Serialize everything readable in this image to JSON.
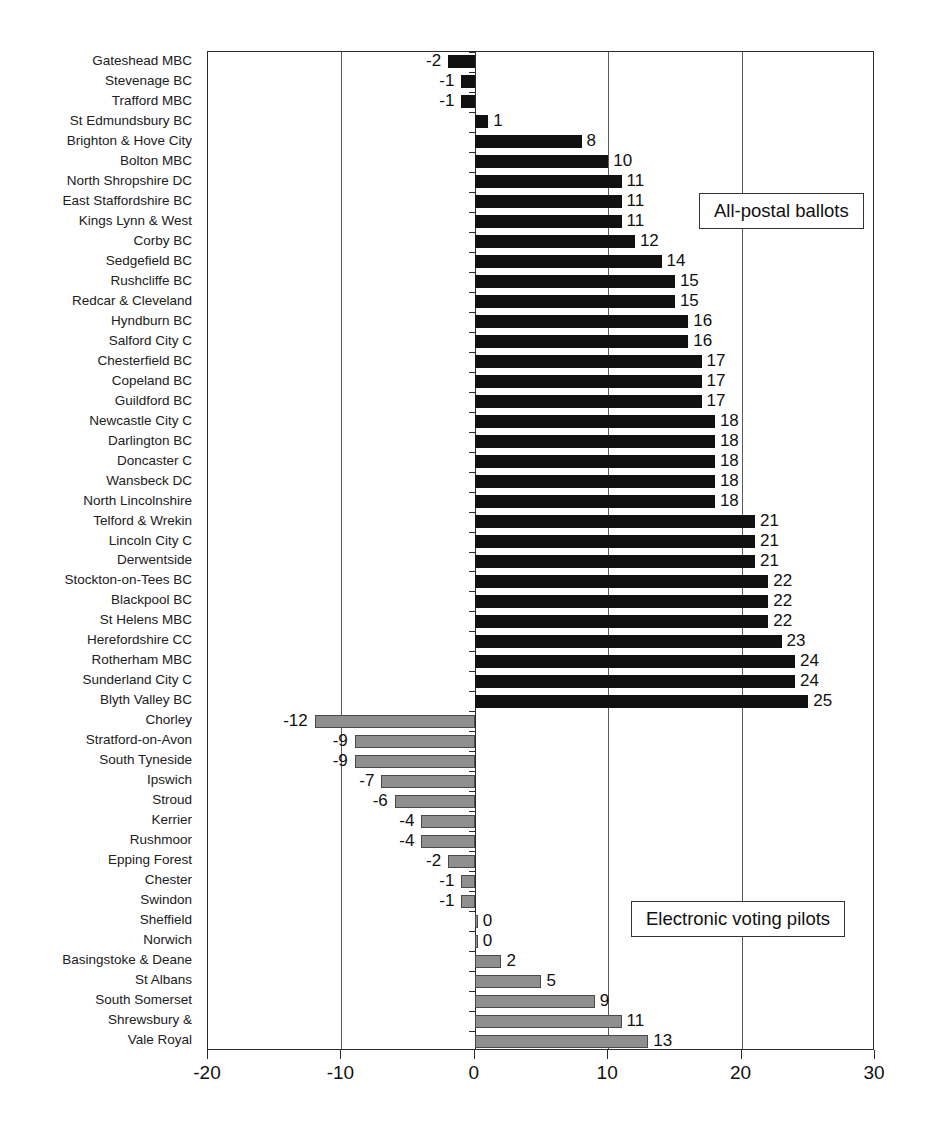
{
  "chart_data": {
    "type": "bar",
    "orientation": "horizontal",
    "title": "",
    "subtitle": "",
    "xlabel": "",
    "ylabel": "",
    "xlim": [
      -20,
      30
    ],
    "xticks": [
      -20,
      -10,
      0,
      10,
      20,
      30
    ],
    "xtick_labels": [
      "-20",
      "-10",
      "0",
      "10",
      "20",
      "30"
    ],
    "grid": true,
    "grid_axis": "x",
    "legend_position": "inside-right",
    "series": [
      {
        "name": "All-postal ballots",
        "color": "#111111",
        "categories": [
          "Gateshead MBC",
          "Stevenage BC",
          "Trafford MBC",
          "St Edmundsbury BC",
          "Brighton & Hove City",
          "Bolton MBC",
          "North Shropshire DC",
          "East Staffordshire BC",
          "Kings Lynn & West",
          "Corby BC",
          "Sedgefield BC",
          "Rushcliffe BC",
          "Redcar & Cleveland",
          "Hyndburn BC",
          "Salford City C",
          "Chesterfield BC",
          "Copeland BC",
          "Guildford BC",
          "Newcastle City C",
          "Darlington BC",
          "Doncaster C",
          "Wansbeck DC",
          "North Lincolnshire",
          "Telford & Wrekin",
          "Lincoln City C",
          "Derwentside",
          "Stockton-on-Tees BC",
          "Blackpool BC",
          "St Helens MBC",
          "Herefordshire CC",
          "Rotherham MBC",
          "Sunderland City C",
          "Blyth Valley BC"
        ],
        "values": [
          -2,
          -1,
          -1,
          1,
          8,
          10,
          11,
          11,
          11,
          12,
          14,
          15,
          15,
          16,
          16,
          17,
          17,
          17,
          18,
          18,
          18,
          18,
          18,
          21,
          21,
          21,
          22,
          22,
          22,
          23,
          24,
          24,
          25
        ]
      },
      {
        "name": "Electronic voting pilots",
        "color": "#8f8f8f",
        "categories": [
          "Chorley",
          "Stratford-on-Avon",
          "South Tyneside",
          "Ipswich",
          "Stroud",
          "Kerrier",
          "Rushmoor",
          "Epping Forest",
          "Chester",
          "Swindon",
          "Sheffield",
          "Norwich",
          "Basingstoke & Deane",
          "St Albans",
          "South Somerset",
          "Shrewsbury &",
          "Vale Royal"
        ],
        "values": [
          -12,
          -9,
          -9,
          -7,
          -6,
          -4,
          -4,
          -2,
          -1,
          -1,
          0,
          0,
          2,
          5,
          9,
          11,
          13
        ]
      }
    ]
  },
  "legend": {
    "postal_label": "All-postal ballots",
    "evote_label": "Electronic voting pilots"
  }
}
